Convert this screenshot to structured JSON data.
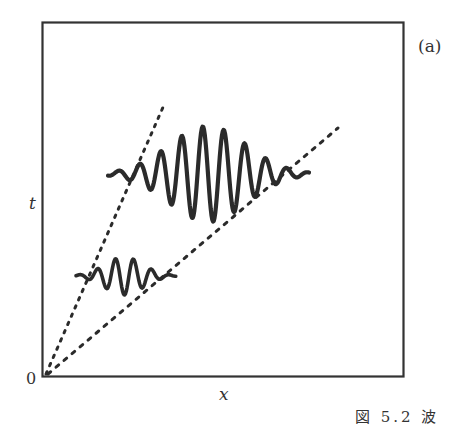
{
  "figure": {
    "panel_label": "(a)",
    "caption_partial": "図 5.2  波",
    "axes": {
      "x_label": "x",
      "y_label": "t",
      "origin_label": "0"
    },
    "colors": {
      "stroke": "#2b2b2b",
      "frame": "#333333",
      "background": "#ffffff"
    },
    "lines": [
      {
        "name": "phase-velocity-line",
        "style": "dotted",
        "from": [
          45,
          376
        ],
        "to": [
          164,
          105
        ]
      },
      {
        "name": "group-velocity-line",
        "style": "dotted",
        "from": [
          45,
          376
        ],
        "to": [
          338,
          128
        ]
      }
    ],
    "wave_packets": [
      {
        "name": "early-wave-packet",
        "x_start": 76,
        "x_end": 176,
        "center_y": 276,
        "amplitude": 19,
        "envelope_center_x": 124
      },
      {
        "name": "later-wave-packet",
        "x_start": 108,
        "x_end": 309,
        "center_y": 174,
        "amplitude": 48,
        "envelope_center_x": 208
      }
    ]
  }
}
